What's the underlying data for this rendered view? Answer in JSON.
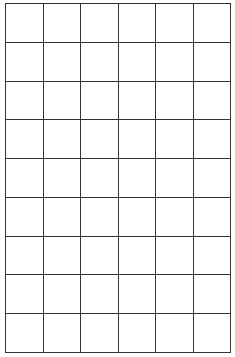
{
  "grid": {
    "columns": 6,
    "rows": 9,
    "line_color": "#333333",
    "background": "#ffffff"
  }
}
